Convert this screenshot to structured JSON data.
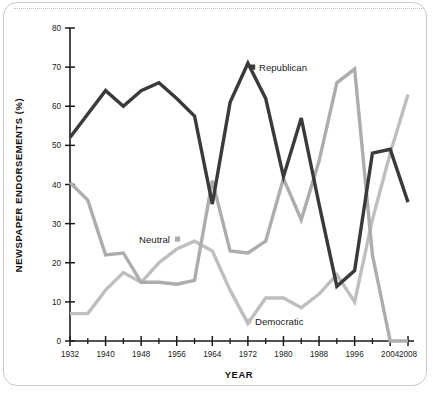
{
  "chart_data": {
    "type": "line",
    "title": "",
    "xlabel": "YEAR",
    "ylabel": "NEWSPAPER ENDORSEMENTS (%)",
    "xlim": [
      1932,
      2008
    ],
    "ylim": [
      0,
      80
    ],
    "grid": false,
    "legend_position": "inline-annotations",
    "x_tick_labels": [
      "1932",
      "1940",
      "1948",
      "1956",
      "1964",
      "1972",
      "1980",
      "1988",
      "1996",
      "2004",
      "2008"
    ],
    "x_tick_values": [
      1932,
      1940,
      1948,
      1956,
      1964,
      1972,
      1980,
      1988,
      1996,
      2004,
      2008
    ],
    "x_minor_tick_values": [
      1936,
      1944,
      1952,
      1960,
      1968,
      1976,
      1984,
      1992,
      2000
    ],
    "y_tick_labels": [
      "0",
      "10",
      "20",
      "30",
      "40",
      "50",
      "60",
      "70",
      "80"
    ],
    "y_tick_values": [
      0,
      10,
      20,
      30,
      40,
      50,
      60,
      70,
      80
    ],
    "x": [
      1932,
      1936,
      1940,
      1944,
      1948,
      1952,
      1956,
      1960,
      1964,
      1968,
      1972,
      1976,
      1980,
      1984,
      1988,
      1992,
      1996,
      2000,
      2004,
      2008
    ],
    "series": [
      {
        "name": "Republican",
        "color": "#3a3a3a",
        "marker": "square",
        "values": [
          52,
          58,
          64,
          60,
          64,
          66,
          62,
          57.5,
          35,
          61,
          71,
          62,
          42,
          57,
          35,
          14,
          18,
          48,
          49,
          35.5
        ]
      },
      {
        "name": "Neutral",
        "color": "#adadad",
        "marker": "square",
        "values": [
          40.5,
          36,
          22,
          22.5,
          15,
          15,
          14.5,
          15.5,
          41,
          23,
          22.5,
          25.5,
          41.5,
          31,
          46,
          66,
          69.5,
          22,
          0,
          0
        ]
      },
      {
        "name": "Democratic",
        "color": "#bfbfbf",
        "marker": "square",
        "values": [
          7,
          7,
          13,
          17.5,
          15,
          20,
          23.5,
          25.5,
          23,
          13,
          4.5,
          11,
          11,
          8.5,
          12,
          17,
          10,
          31,
          48,
          63
        ]
      }
    ],
    "annotations": [
      {
        "label": "Republican",
        "series": "Republican",
        "color": "#3a3a3a"
      },
      {
        "label": "Neutral",
        "series": "Neutral",
        "color": "#adadad"
      },
      {
        "label": "Democratic",
        "series": "Democratic",
        "color": "#bfbfbf"
      }
    ]
  },
  "annotation_layout": {
    "republican": {
      "marker_x": 250,
      "marker_y": 68,
      "text_x": 259,
      "text_y": 71,
      "anchor": "start"
    },
    "neutral": {
      "marker_x": 175,
      "marker_y": 240,
      "text_x": 170,
      "text_y": 243,
      "anchor": "end"
    },
    "democratic": {
      "marker_x": 246,
      "marker_y": 322,
      "text_x": 255,
      "text_y": 325,
      "anchor": "start"
    }
  },
  "plot_geometry": {
    "x_left_px": 70,
    "x_right_px": 408,
    "y_zero_px": 341,
    "y_top_px": 28,
    "year_min": 1932,
    "year_max": 2008,
    "value_min": 0,
    "value_max": 80
  }
}
